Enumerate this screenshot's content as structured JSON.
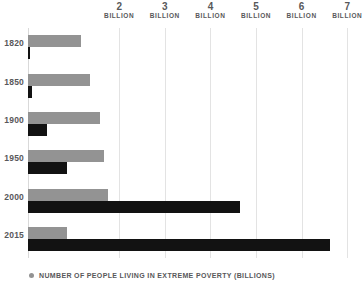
{
  "chart_data": {
    "type": "bar",
    "orientation": "horizontal",
    "title": "",
    "subtitle": "",
    "xlabel": "",
    "ylabel": "",
    "xlim": [
      0,
      7.06
    ],
    "ylim": null,
    "grid": true,
    "legend_position": "bottom-left",
    "categories": [
      "1820",
      "1850",
      "1900",
      "1950",
      "2000",
      "2015"
    ],
    "axis_ticks": [
      {
        "value": 2,
        "number": "2",
        "unit": "BILLION"
      },
      {
        "value": 3,
        "number": "3",
        "unit": "BILLION"
      },
      {
        "value": 4,
        "number": "4",
        "unit": "BILLION"
      },
      {
        "value": 5,
        "number": "5",
        "unit": "BILLION"
      },
      {
        "value": 6,
        "number": "6",
        "unit": "BILLION"
      },
      {
        "value": 7,
        "number": "7",
        "unit": "BILLION"
      }
    ],
    "series": [
      {
        "name": "NUMBER OF PEOPLE LIVING IN EXTREME POVERTY (BILLIONS)",
        "color": "#939393",
        "values": [
          1.16,
          1.36,
          1.58,
          1.67,
          1.76,
          0.86
        ]
      },
      {
        "name": "",
        "color": "#121212",
        "values": [
          0.04,
          0.09,
          0.42,
          0.86,
          4.65,
          6.62
        ]
      }
    ],
    "legend": [
      {
        "label": "NUMBER OF PEOPLE LIVING IN EXTREME POVERTY (BILLIONS)",
        "color": "#939393"
      }
    ]
  },
  "colors": {
    "poverty_gray": "#939393",
    "population_black": "#121212",
    "gridline": "#e3e3e3",
    "text": "#58585a",
    "background": "#ffffff"
  }
}
